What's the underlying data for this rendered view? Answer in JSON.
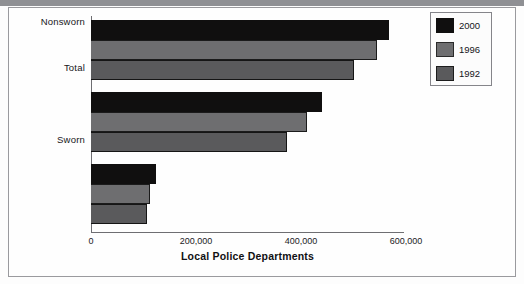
{
  "chart_data": {
    "type": "bar",
    "orientation": "horizontal",
    "title": "",
    "xlabel": "Local Police Departments",
    "ylabel": "",
    "categories": [
      "Total",
      "Sworn",
      "Nonsworn"
    ],
    "series": [
      {
        "name": "2000",
        "color": "#100f0f",
        "values": [
          568000,
          440000,
          124000
        ]
      },
      {
        "name": "1996",
        "color": "#6e6e70",
        "values": [
          545000,
          411000,
          112000
        ]
      },
      {
        "name": "1992",
        "color": "#5a5a5c",
        "values": [
          500000,
          373000,
          107000
        ]
      }
    ],
    "xlim": [
      0,
      620000
    ],
    "xticks": [
      0,
      200000,
      400000,
      600000
    ],
    "xtick_labels": [
      "0",
      "200,000",
      "400,000",
      "600,000"
    ],
    "grid": false,
    "legend_position": "top-right",
    "legend_entries": [
      "2000",
      "1996",
      "1992"
    ]
  },
  "axis": {
    "x_title": "Local Police Departments",
    "ticks": [
      {
        "label": "0",
        "value": 0
      },
      {
        "label": "200,000",
        "value": 200000
      },
      {
        "label": "400,000",
        "value": 400000
      },
      {
        "label": "600,000",
        "value": 600000
      }
    ]
  },
  "categories": [
    {
      "label": "Total"
    },
    {
      "label": "Sworn"
    },
    {
      "label": "Nonsworn"
    }
  ],
  "legend": {
    "items": [
      {
        "label": "2000",
        "color": "#100f0f"
      },
      {
        "label": "1996",
        "color": "#6e6e70"
      },
      {
        "label": "1992",
        "color": "#5a5a5c"
      }
    ]
  }
}
